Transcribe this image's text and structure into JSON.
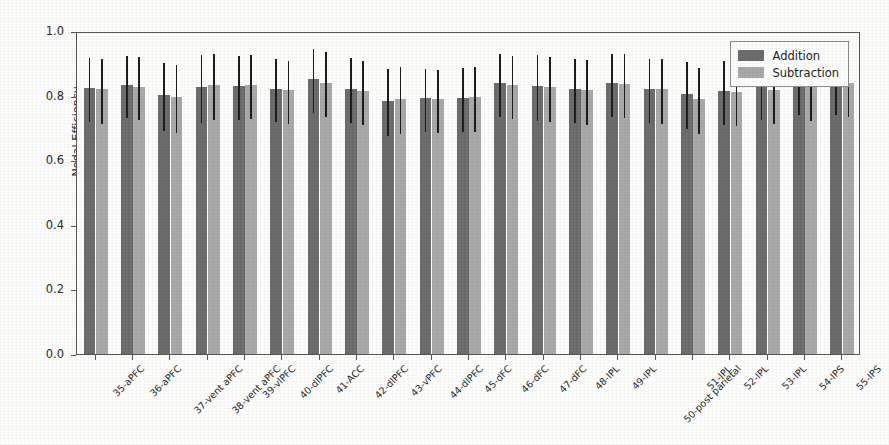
{
  "chart_data": {
    "type": "bar",
    "title": "",
    "xlabel": "",
    "ylabel": "Nodal Efficiency",
    "ylim": [
      0.0,
      1.0
    ],
    "yticks": [
      "0.0",
      "0.2",
      "0.4",
      "0.6",
      "0.8",
      "1.0"
    ],
    "ytick_values": [
      0.0,
      0.2,
      0.4,
      0.6,
      0.8,
      1.0
    ],
    "grid": false,
    "legend_position": "upper right",
    "error_bars": "symmetric std-dev whiskers",
    "categories": [
      "35-aPFC",
      "36-aPFC",
      "37-vent aPFC",
      "38-vent aPFC",
      "39-vlPFC",
      "40-dlPFC",
      "41-ACC",
      "42-dlPFC",
      "43-vPFC",
      "44-dlPFC",
      "45-dFC",
      "46-dFC",
      "47-dFC",
      "48-IPL",
      "49-IPL",
      "50-post parietal",
      "51-IPL",
      "52-IPL",
      "53-IPL",
      "54-IPS",
      "55-IPS"
    ],
    "series": [
      {
        "name": "Addition",
        "color": "#6d6d6d",
        "values": [
          0.823,
          0.833,
          0.802,
          0.826,
          0.831,
          0.822,
          0.851,
          0.822,
          0.784,
          0.792,
          0.793,
          0.838,
          0.83,
          0.821,
          0.838,
          0.82,
          0.806,
          0.814,
          0.832,
          0.845,
          0.845
        ],
        "errors": [
          0.1,
          0.097,
          0.104,
          0.106,
          0.099,
          0.097,
          0.1,
          0.101,
          0.104,
          0.098,
          0.1,
          0.098,
          0.102,
          0.1,
          0.098,
          0.1,
          0.104,
          0.1,
          0.1,
          0.1,
          0.1
        ]
      },
      {
        "name": "Subtraction",
        "color": "#a9a9a9",
        "values": [
          0.819,
          0.828,
          0.796,
          0.833,
          0.834,
          0.816,
          0.84,
          0.814,
          0.791,
          0.788,
          0.795,
          0.832,
          0.826,
          0.816,
          0.836,
          0.819,
          0.789,
          0.811,
          0.818,
          0.826,
          0.84
        ],
        "errors": [
          0.1,
          0.097,
          0.105,
          0.102,
          0.099,
          0.098,
          0.1,
          0.1,
          0.103,
          0.098,
          0.1,
          0.098,
          0.101,
          0.1,
          0.098,
          0.1,
          0.103,
          0.1,
          0.1,
          0.1,
          0.1
        ]
      }
    ]
  },
  "legend": {
    "entries": [
      {
        "label": "Addition"
      },
      {
        "label": "Subtraction"
      }
    ]
  }
}
